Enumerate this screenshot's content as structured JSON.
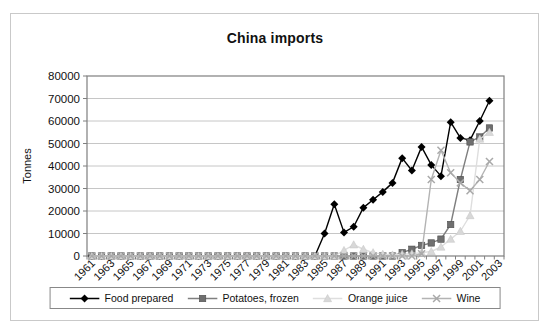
{
  "chart_data": {
    "type": "line",
    "title": "China imports",
    "ylabel": "Tonnes",
    "xlabel": "",
    "ylim": [
      0,
      80000
    ],
    "ytick_step": 10000,
    "grid": true,
    "legend_position": "bottom",
    "x_tick_label_interval": 2,
    "categories": [
      "1961",
      "1962",
      "1963",
      "1964",
      "1965",
      "1966",
      "1967",
      "1968",
      "1969",
      "1970",
      "1971",
      "1972",
      "1973",
      "1974",
      "1975",
      "1976",
      "1977",
      "1978",
      "1979",
      "1980",
      "1981",
      "1982",
      "1983",
      "1984",
      "1985",
      "1986",
      "1987",
      "1988",
      "1989",
      "1990",
      "1991",
      "1992",
      "1993",
      "1994",
      "1995",
      "1996",
      "1997",
      "1998",
      "1999",
      "2000",
      "2001",
      "2002",
      "2003"
    ],
    "series": [
      {
        "name": "Food prepared",
        "marker": "diamond",
        "color": "#000000",
        "line_color": "#000000",
        "values": [
          0,
          0,
          0,
          0,
          0,
          0,
          0,
          0,
          0,
          0,
          0,
          0,
          0,
          0,
          0,
          0,
          0,
          0,
          0,
          0,
          0,
          0,
          0,
          0,
          10000,
          23000,
          10500,
          13000,
          21500,
          25000,
          28500,
          32500,
          43500,
          38000,
          48500,
          40500,
          35500,
          59500,
          52500,
          51500,
          60000,
          69000,
          null
        ]
      },
      {
        "name": "Potatoes, frozen",
        "marker": "square",
        "color": "#6f6f6f",
        "line_color": "#7f7f7f",
        "values": [
          0,
          0,
          0,
          0,
          0,
          0,
          0,
          0,
          0,
          0,
          0,
          0,
          0,
          0,
          0,
          0,
          0,
          0,
          0,
          0,
          0,
          0,
          0,
          0,
          0,
          0,
          0,
          0,
          0,
          0,
          0,
          0,
          1500,
          3000,
          4700,
          5800,
          7500,
          14000,
          34000,
          50700,
          52900,
          56900,
          null
        ]
      },
      {
        "name": "Orange juice",
        "marker": "triangle",
        "color": "#d8d8d8",
        "line_color": "#dedede",
        "values": [
          0,
          0,
          0,
          0,
          0,
          0,
          0,
          0,
          0,
          0,
          0,
          0,
          0,
          0,
          0,
          0,
          0,
          0,
          0,
          0,
          0,
          0,
          0,
          0,
          0,
          0,
          2500,
          5000,
          3000,
          1500,
          800,
          500,
          800,
          1000,
          1500,
          2000,
          4000,
          7500,
          11000,
          18000,
          52000,
          55000,
          null
        ]
      },
      {
        "name": "Wine",
        "marker": "x",
        "color": "#a9a9a9",
        "line_color": "#b3b3b3",
        "values": [
          0,
          0,
          0,
          0,
          0,
          0,
          0,
          0,
          0,
          0,
          0,
          0,
          0,
          0,
          0,
          0,
          0,
          0,
          0,
          0,
          0,
          0,
          0,
          0,
          0,
          0,
          0,
          0,
          0,
          0,
          0,
          0,
          0,
          0,
          1000,
          34000,
          47000,
          37000,
          32500,
          29000,
          34000,
          42000,
          null
        ]
      }
    ],
    "colors": {
      "plot_background": "#ffffff",
      "plot_border": "#7f7f7f",
      "gridline": "#c6c6c6",
      "axis_text": "#111111"
    }
  }
}
